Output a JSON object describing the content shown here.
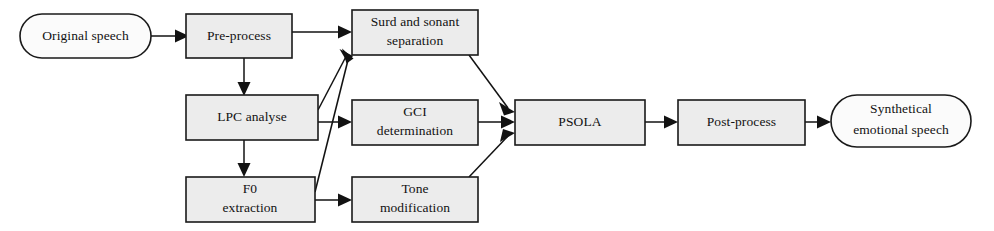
{
  "diagram": {
    "type": "flowchart",
    "background_color": "#ffffff",
    "node_fill_color": "#ececec",
    "terminal_fill_color": "#fbfbfb",
    "line_color": "#121212",
    "nodes": [
      {
        "id": "original_speech",
        "label_line1": "Original speech",
        "label_line2": "",
        "shape": "stadium"
      },
      {
        "id": "pre_process",
        "label_line1": "Pre-process",
        "label_line2": "",
        "shape": "rect"
      },
      {
        "id": "surd_sonant",
        "label_line1": "Surd and sonant",
        "label_line2": "separation",
        "shape": "rect"
      },
      {
        "id": "lpc_analyse",
        "label_line1": "LPC analyse",
        "label_line2": "",
        "shape": "rect"
      },
      {
        "id": "gci_determination",
        "label_line1": "GCI",
        "label_line2": "determination",
        "shape": "rect"
      },
      {
        "id": "f0_extraction",
        "label_line1": "F0",
        "label_line2": "extraction",
        "shape": "rect"
      },
      {
        "id": "tone_modification",
        "label_line1": "Tone",
        "label_line2": "modification",
        "shape": "rect"
      },
      {
        "id": "psola",
        "label_line1": "PSOLA",
        "label_line2": "",
        "shape": "rect"
      },
      {
        "id": "post_process",
        "label_line1": "Post-process",
        "label_line2": "",
        "shape": "rect"
      },
      {
        "id": "synthetical_speech",
        "label_line1": "Synthetical",
        "label_line2": "emotional speech",
        "shape": "stadium"
      }
    ],
    "edges": [
      {
        "from": "original_speech",
        "to": "pre_process",
        "style": "straight"
      },
      {
        "from": "pre_process",
        "to": "surd_sonant",
        "style": "straight"
      },
      {
        "from": "pre_process",
        "to": "lpc_analyse",
        "style": "straight"
      },
      {
        "from": "lpc_analyse",
        "to": "surd_sonant",
        "style": "diagonal"
      },
      {
        "from": "lpc_analyse",
        "to": "gci_determination",
        "style": "straight"
      },
      {
        "from": "lpc_analyse",
        "to": "f0_extraction",
        "style": "straight"
      },
      {
        "from": "f0_extraction",
        "to": "surd_sonant",
        "style": "diagonal"
      },
      {
        "from": "f0_extraction",
        "to": "tone_modification",
        "style": "straight"
      },
      {
        "from": "surd_sonant",
        "to": "psola",
        "style": "diagonal"
      },
      {
        "from": "gci_determination",
        "to": "psola",
        "style": "straight"
      },
      {
        "from": "tone_modification",
        "to": "psola",
        "style": "diagonal"
      },
      {
        "from": "psola",
        "to": "post_process",
        "style": "straight"
      },
      {
        "from": "post_process",
        "to": "synthetical_speech",
        "style": "straight"
      }
    ]
  }
}
